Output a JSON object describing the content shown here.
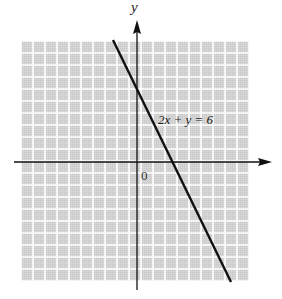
{
  "chart_data": {
    "type": "line",
    "title": "",
    "xlabel": "",
    "ylabel": "y",
    "origin_label": "0",
    "equation_label": "2x + y = 6",
    "series": [
      {
        "name": "2x + y = 6",
        "x": [
          -2,
          8
        ],
        "y": [
          10,
          -10
        ]
      }
    ],
    "y_intercept": [
      0,
      6
    ],
    "x_intercept": [
      3,
      0
    ],
    "xlim": [
      -10,
      9.5
    ],
    "ylim": [
      -10,
      10
    ],
    "grid": true,
    "grid_unit": 1
  },
  "colors": {
    "grid_bg": "#d4d4d4",
    "grid_line": "#ffffff",
    "axis": "#111111",
    "line": "#111111"
  }
}
